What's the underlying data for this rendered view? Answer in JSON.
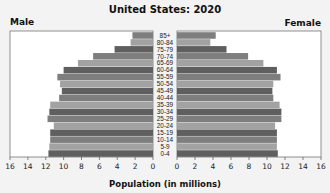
{
  "chart_data": {
    "type": "bar",
    "subtype": "population-pyramid",
    "title": "United States: 2020",
    "left_label": "Male",
    "right_label": "Female",
    "xlabel": "Population (in millions)",
    "ylabel": "",
    "xlim": [
      0,
      16
    ],
    "x_ticks": [
      0,
      2,
      4,
      6,
      8,
      10,
      12,
      14,
      16
    ],
    "grid": false,
    "legend": "none",
    "categories": [
      "0-4",
      "5-9",
      "10-14",
      "15-19",
      "20-24",
      "25-29",
      "30-34",
      "35-39",
      "40-44",
      "45-49",
      "50-54",
      "55-59",
      "60-64",
      "65-69",
      "70-74",
      "75-79",
      "80-84",
      "85+"
    ],
    "series": [
      {
        "name": "Male",
        "values": [
          11.7,
          11.6,
          11.5,
          11.5,
          11.1,
          11.8,
          11.6,
          11.5,
          10.5,
          10.2,
          10.4,
          10.7,
          10.0,
          8.4,
          6.7,
          4.3,
          2.5,
          2.3
        ]
      },
      {
        "name": "Female",
        "values": [
          11.2,
          11.1,
          11.1,
          11.1,
          10.9,
          11.6,
          11.6,
          11.4,
          10.7,
          10.6,
          10.7,
          11.5,
          11.1,
          9.6,
          7.9,
          5.5,
          3.7,
          4.3
        ]
      }
    ],
    "bar_shades": [
      "#5f5f5f",
      "#a2a2a2",
      "#7e7e7e"
    ]
  }
}
